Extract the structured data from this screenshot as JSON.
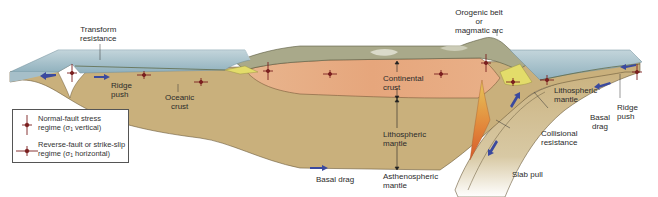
{
  "figure": {
    "type": "cross-section"
  },
  "colors": {
    "ocean_water": "#9db8c4",
    "ocean_top": "#b9ccd3",
    "lithospheric_mantle": "#c9b07c",
    "continental_crust": "#e6a67c",
    "continental_surface": "#a9a98a",
    "oceanic_crust_line": "#5f6b4a",
    "stress_symbol": "#7a1f1f",
    "force_arrow": "#3b4a9e",
    "magma": "#e08a3a",
    "wedge_yellow": "#e3dc6a"
  },
  "labels": {
    "transform_resistance": [
      "Transform",
      "resistance"
    ],
    "ridge_push_left": [
      "Ridge",
      "push"
    ],
    "oceanic_crust": [
      "Oceanic",
      "crust"
    ],
    "continental_crust": [
      "Continental",
      "crust"
    ],
    "lithospheric_mantle_center": [
      "Lithospheric",
      "mantle"
    ],
    "asthenospheric_mantle": [
      "Asthenospheric",
      "mantle"
    ],
    "basal_drag_center": "Basal drag",
    "orogenic_belt": [
      "Orogenic belt",
      "or",
      "magmatic arc"
    ],
    "lithospheric_mantle_right": [
      "Lithospheric",
      "mantle"
    ],
    "basal_drag_right": [
      "Basal",
      "drag"
    ],
    "ridge_push_right": [
      "Ridge",
      "push"
    ],
    "collisional_resistance": [
      "Collisional",
      "resistance"
    ],
    "slab_pull": "Slab pull"
  },
  "legend": {
    "items": [
      {
        "symbol": "normal-fault-stress-symbol",
        "line1": "Normal-fault stress",
        "line2_prefix": "regime (σ",
        "line2_sub": "1",
        "line2_suffix": " vertical)"
      },
      {
        "symbol": "reverse-fault-stress-symbol",
        "line1": "Reverse-fault or strike-slip",
        "line2_prefix": "regime (σ",
        "line2_sub": "1",
        "line2_suffix": " horizontal)"
      }
    ]
  }
}
